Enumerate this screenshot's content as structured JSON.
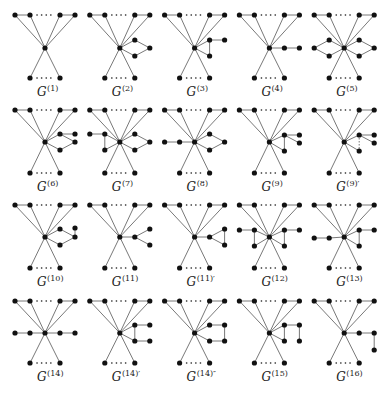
{
  "figure": {
    "rows": 4,
    "cols": 5,
    "col_step": 75,
    "row_layout": [
      {
        "top_y": 15,
        "center_y": 48,
        "bottom_y": 78,
        "label_y": 96
      },
      {
        "top_y": 110,
        "center_y": 142,
        "bottom_y": 173,
        "label_y": 191
      },
      {
        "top_y": 205,
        "center_y": 237,
        "bottom_y": 268,
        "label_y": 286
      },
      {
        "top_y": 301,
        "center_y": 333,
        "bottom_y": 363,
        "label_y": 381
      }
    ],
    "panels": [
      {
        "label": "G",
        "sup": "(1)",
        "extra": []
      },
      {
        "label": "G",
        "sup": "(2)",
        "extra": [
          {
            "nodes": [
              [
                60,
                -8
              ],
              [
                75,
                0
              ],
              [
                60,
                8
              ]
            ],
            "edges": [
              [
                "c",
                0
              ],
              [
                0,
                1
              ],
              [
                1,
                2
              ],
              [
                2,
                "c"
              ]
            ]
          }
        ]
      },
      {
        "label": "G",
        "sup": "(3)",
        "extra": [
          {
            "nodes": [
              [
                60,
                -8
              ],
              [
                75,
                -8
              ],
              [
                60,
                8
              ]
            ],
            "edges": [
              [
                "c",
                0
              ],
              [
                0,
                1
              ],
              [
                0,
                2
              ],
              [
                "c",
                2
              ]
            ]
          }
        ]
      },
      {
        "label": "G",
        "sup": "(4)",
        "extra": [
          {
            "nodes": [
              [
                60,
                0
              ],
              [
                75,
                0
              ]
            ],
            "edges": [
              [
                "c",
                0
              ],
              [
                0,
                1
              ]
            ]
          }
        ]
      },
      {
        "label": "G",
        "sup": "(5)",
        "extra": [
          {
            "nodes": [
              [
                60,
                -8
              ],
              [
                75,
                0
              ],
              [
                60,
                8
              ]
            ],
            "edges": [
              [
                "c",
                0
              ],
              [
                0,
                1
              ],
              [
                1,
                2
              ],
              [
                2,
                "c"
              ]
            ]
          },
          {
            "nodes": [
              [
                30,
                -8
              ],
              [
                15,
                0
              ],
              [
                30,
                8
              ]
            ],
            "edges": [
              [
                "c",
                0
              ],
              [
                0,
                1
              ],
              [
                1,
                2
              ],
              [
                2,
                "c"
              ]
            ]
          }
        ]
      },
      {
        "label": "G",
        "sup": "(6)",
        "extra": [
          {
            "nodes": [
              [
                60,
                -8
              ],
              [
                75,
                -8
              ],
              [
                75,
                0
              ],
              [
                60,
                8
              ]
            ],
            "edges": [
              [
                "c",
                0
              ],
              [
                0,
                1
              ],
              [
                0,
                2
              ],
              [
                2,
                3
              ],
              [
                3,
                "c"
              ]
            ]
          }
        ]
      },
      {
        "label": "G",
        "sup": "(7)",
        "extra": [
          {
            "nodes": [
              [
                60,
                -8
              ],
              [
                75,
                0
              ],
              [
                60,
                8
              ]
            ],
            "edges": [
              [
                "c",
                0
              ],
              [
                0,
                1
              ],
              [
                1,
                2
              ],
              [
                2,
                "c"
              ]
            ]
          },
          {
            "nodes": [
              [
                15,
                -8
              ],
              [
                30,
                -8
              ],
              [
                30,
                8
              ]
            ],
            "edges": [
              [
                0,
                1
              ],
              [
                1,
                "c"
              ],
              [
                1,
                2
              ],
              [
                2,
                "c"
              ]
            ]
          }
        ]
      },
      {
        "label": "G",
        "sup": "(8)",
        "extra": [
          {
            "nodes": [
              [
                60,
                -8
              ],
              [
                75,
                0
              ],
              [
                60,
                8
              ]
            ],
            "edges": [
              [
                "c",
                0
              ],
              [
                0,
                1
              ],
              [
                1,
                2
              ],
              [
                2,
                "c"
              ]
            ]
          },
          {
            "nodes": [
              [
                15,
                0
              ],
              [
                30,
                0
              ]
            ],
            "edges": [
              [
                0,
                1
              ],
              [
                1,
                "c"
              ]
            ]
          }
        ]
      },
      {
        "label": "G",
        "sup": "(9)",
        "extra": [
          {
            "nodes": [
              [
                60,
                -7
              ],
              [
                75,
                -7
              ],
              [
                75,
                1
              ],
              [
                60,
                9
              ]
            ],
            "edges": [
              [
                "c",
                0
              ],
              [
                0,
                1
              ],
              [
                0,
                2
              ],
              [
                "c",
                3
              ],
              [
                0,
                3
              ]
            ]
          }
        ]
      },
      {
        "label": "G",
        "sup": "(9)′",
        "extra": [
          {
            "nodes": [
              [
                60,
                -7
              ],
              [
                75,
                -7
              ],
              [
                75,
                1
              ],
              [
                60,
                9
              ]
            ],
            "edges": [
              [
                "c",
                0
              ],
              [
                0,
                1
              ],
              [
                0,
                2
              ],
              [
                "c",
                3
              ]
            ],
            "dashed": [
              [
                0,
                3
              ]
            ]
          }
        ]
      },
      {
        "label": "G",
        "sup": "(10)",
        "extra": [
          {
            "nodes": [
              [
                60,
                -8
              ],
              [
                75,
                0
              ],
              [
                75,
                -9
              ],
              [
                60,
                8
              ]
            ],
            "edges": [
              [
                "c",
                0
              ],
              [
                0,
                1
              ],
              [
                1,
                2
              ],
              [
                1,
                3
              ],
              [
                3,
                "c"
              ]
            ]
          }
        ]
      },
      {
        "label": "G",
        "sup": "(11)",
        "extra": [
          {
            "nodes": [
              [
                60,
                0
              ],
              [
                75,
                -8
              ],
              [
                75,
                8
              ]
            ],
            "edges": [
              [
                "c",
                0
              ],
              [
                0,
                1
              ],
              [
                0,
                2
              ]
            ]
          }
        ]
      },
      {
        "label": "G",
        "sup": "(11)′",
        "extra": [
          {
            "nodes": [
              [
                60,
                0
              ],
              [
                75,
                -8
              ],
              [
                75,
                8
              ]
            ],
            "edges": [
              [
                "c",
                0
              ],
              [
                0,
                1
              ],
              [
                0,
                2
              ],
              [
                1,
                2
              ]
            ]
          }
        ]
      },
      {
        "label": "G",
        "sup": "(12)",
        "extra": [
          {
            "nodes": [
              [
                60,
                -7
              ],
              [
                75,
                -7
              ],
              [
                60,
                9
              ]
            ],
            "edges": [
              [
                "c",
                0
              ],
              [
                0,
                1
              ],
              [
                0,
                2
              ],
              [
                "c",
                2
              ]
            ]
          },
          {
            "nodes": [
              [
                30,
                -7
              ],
              [
                15,
                -7
              ],
              [
                30,
                9
              ]
            ],
            "edges": [
              [
                "c",
                0
              ],
              [
                0,
                1
              ],
              [
                0,
                2
              ],
              [
                "c",
                2
              ]
            ]
          }
        ]
      },
      {
        "label": "G",
        "sup": "(13)",
        "extra": [
          {
            "nodes": [
              [
                60,
                -7
              ],
              [
                75,
                -7
              ],
              [
                60,
                9
              ]
            ],
            "edges": [
              [
                "c",
                0
              ],
              [
                0,
                1
              ],
              [
                0,
                2
              ],
              [
                "c",
                2
              ]
            ]
          },
          {
            "nodes": [
              [
                30,
                1
              ],
              [
                15,
                1
              ]
            ],
            "edges": [
              [
                "c",
                0
              ],
              [
                0,
                1
              ]
            ]
          }
        ]
      },
      {
        "label": "G",
        "sup": "(14)",
        "extra": [
          {
            "nodes": [
              [
                60,
                0
              ],
              [
                75,
                0
              ]
            ],
            "edges": [
              [
                "c",
                0
              ],
              [
                0,
                1
              ]
            ]
          },
          {
            "nodes": [
              [
                30,
                0
              ],
              [
                15,
                0
              ]
            ],
            "edges": [
              [
                "c",
                0
              ],
              [
                0,
                1
              ]
            ]
          }
        ]
      },
      {
        "label": "G",
        "sup": "(14)′",
        "extra": [
          {
            "nodes": [
              [
                60,
                -8
              ],
              [
                75,
                -8
              ],
              [
                60,
                8
              ],
              [
                75,
                8
              ]
            ],
            "edges": [
              [
                "c",
                0
              ],
              [
                "c",
                2
              ],
              [
                0,
                2
              ],
              [
                0,
                1
              ],
              [
                2,
                3
              ]
            ]
          }
        ]
      },
      {
        "label": "G",
        "sup": "(14)″",
        "extra": [
          {
            "nodes": [
              [
                60,
                -8
              ],
              [
                75,
                -8
              ],
              [
                60,
                8
              ],
              [
                75,
                8
              ]
            ],
            "edges": [
              [
                "c",
                0
              ],
              [
                "c",
                2
              ],
              [
                0,
                1
              ],
              [
                1,
                3
              ],
              [
                2,
                3
              ]
            ]
          }
        ]
      },
      {
        "label": "G",
        "sup": "(15)",
        "extra": [
          {
            "nodes": [
              [
                60,
                -8
              ],
              [
                75,
                -8
              ],
              [
                60,
                8
              ],
              [
                75,
                8
              ]
            ],
            "edges": [
              [
                "c",
                0
              ],
              [
                "c",
                2
              ],
              [
                0,
                1
              ],
              [
                0,
                2
              ],
              [
                1,
                3
              ]
            ]
          }
        ]
      },
      {
        "label": "G",
        "sup": "(16)",
        "extra": [
          {
            "nodes": [
              [
                60,
                0
              ],
              [
                75,
                0
              ],
              [
                75,
                17
              ]
            ],
            "edges": [
              [
                "c",
                0
              ],
              [
                0,
                1
              ],
              [
                1,
                2
              ]
            ]
          }
        ]
      }
    ],
    "base_graph": {
      "top_nodes_x": [
        15,
        30,
        60,
        75
      ],
      "center_x": 45,
      "bottom_nodes_x": [
        30,
        60
      ]
    }
  }
}
